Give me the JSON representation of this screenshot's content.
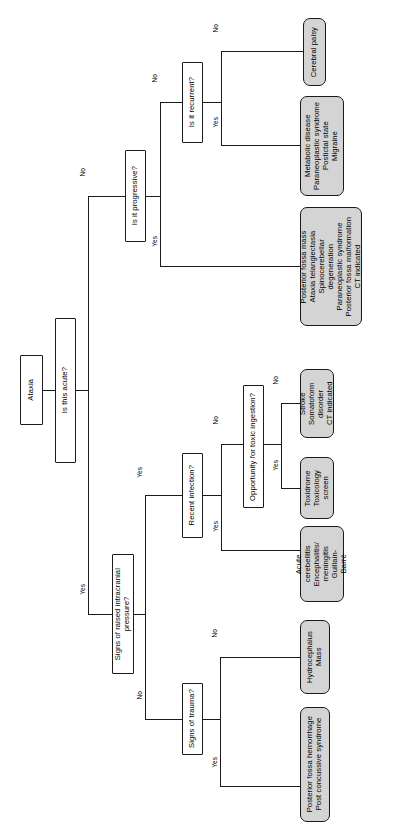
{
  "diagram": {
    "orientation": "rotated-90-ccw",
    "root": {
      "label": "Ataxia"
    },
    "decisions": {
      "acute": "Is this acute?",
      "progressive": "Is it progressive?",
      "recurrent": "Is it recurrent?",
      "raised_icp": "Signs of raised intracranial\npressure?",
      "trauma": "Signs of trauma?",
      "recent_infection": "Recent infection?",
      "toxic_ingestion": "Opportunity for toxic ingestion?"
    },
    "outcomes": {
      "cerebral_palsy": "Cerebral palsy",
      "metabolic": "Metabolic disease\nParaneoplastic syndrome\nPostictal state\nMigraine",
      "posterior_fossa_mass": "Posterior fossa mass\nAtaxia telangiectasia\nSpinocerebellar\n   degeneration\nParaneoplastic syndrome\nPosterior fossa malformation\nCT indicated",
      "stroke": "Stroke\nSomatoform disorder\nCT indicated",
      "toxidrome": "Toxidrome\nToxicology\nscreen",
      "acute_cerebellitis": "Acute\n   cerebellitis\nEncephalitis/\n   meningitis\nGuillain-\n   Barré",
      "hydrocephalus": "Hydrocephalus\nMass",
      "posterior_fossa_hemorrhage": "Posterior fossa hemorrhage\nPost concussive syndrome"
    },
    "edge_labels": {
      "acute_no": "No",
      "acute_yes": "Yes",
      "progressive_no": "No",
      "progressive_yes": "Yes",
      "recurrent_no": "No",
      "recurrent_yes": "Yes",
      "icp_yes": "Yes",
      "icp_no": "No",
      "trauma_yes": "Yes",
      "trauma_no": "No",
      "infection_yes": "Yes",
      "infection_no": "No",
      "toxic_yes": "Yes",
      "toxic_no": "No"
    },
    "colors": {
      "outcome_fill": "#d4d4d4",
      "stroke": "#1a1a1a",
      "decision_fill": "#ffffff",
      "background": "#ffffff"
    }
  }
}
